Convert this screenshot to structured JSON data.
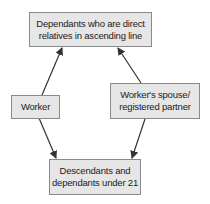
{
  "diagram": {
    "nodes": [
      {
        "id": "ascending",
        "label": "Dependants who are direct relatives in ascending line",
        "line1": "Dependants who are direct",
        "line2": "relatives in ascending line"
      },
      {
        "id": "worker",
        "label": "Worker"
      },
      {
        "id": "spouse",
        "label": "Worker's spouse/ registered partner",
        "line1": "Worker's spouse/",
        "line2": "registered partner"
      },
      {
        "id": "descendants",
        "label": "Descendants and dependants under 21",
        "line1": "Descendants and",
        "line2": "dependants under 21"
      }
    ],
    "edges": [
      {
        "from": "worker",
        "to": "ascending"
      },
      {
        "from": "spouse",
        "to": "ascending"
      },
      {
        "from": "worker",
        "to": "descendants"
      },
      {
        "from": "spouse",
        "to": "descendants"
      }
    ],
    "colors": {
      "box_fill": "#e6e6e6",
      "box_border": "#8a8a8a",
      "arrow": "#333333"
    }
  }
}
